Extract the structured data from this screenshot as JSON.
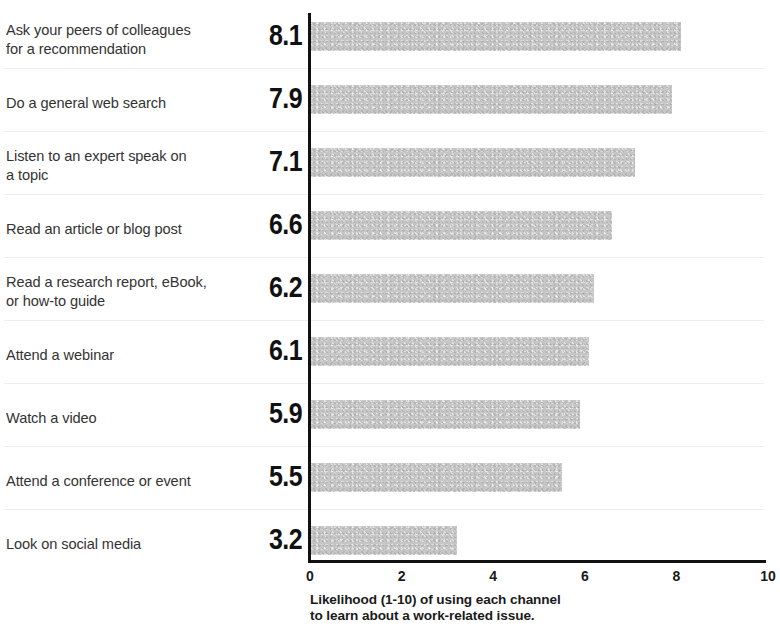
{
  "chart_data": {
    "type": "bar",
    "orientation": "horizontal",
    "title": "",
    "xlabel": "Likelihood (1-10) of using each channel\nto learn about a work-related issue.",
    "ylabel": "",
    "xlim": [
      0,
      10
    ],
    "xticks": [
      "0",
      "2",
      "4",
      "6",
      "8",
      "10"
    ],
    "xtick_values": [
      0,
      2,
      4,
      6,
      8,
      10
    ],
    "grid": false,
    "legend": false,
    "bar_color": "#c6c6c6",
    "categories": [
      "Ask your peers of colleagues\nfor a recommendation",
      "Do a general web search",
      "Listen to an expert speak on\na topic",
      "Read an article or blog post",
      "Read a research report, eBook,\nor how-to guide",
      "Attend a webinar",
      "Watch a video",
      "Attend a conference or event",
      "Look on social media"
    ],
    "values": [
      8.1,
      7.9,
      7.1,
      6.6,
      6.2,
      6.1,
      5.9,
      5.5,
      3.2
    ],
    "value_labels": [
      "8.1",
      "7.9",
      "7.1",
      "6.6",
      "6.2",
      "6.1",
      "5.9",
      "5.5",
      "3.2"
    ]
  },
  "rows": [
    {
      "label": "Ask your peers of colleagues\nfor a recommendation",
      "value": "8.1"
    },
    {
      "label": "Do a general web search",
      "value": "7.9"
    },
    {
      "label": "Listen to an expert speak on\na topic",
      "value": "7.1"
    },
    {
      "label": "Read an article or blog post",
      "value": "6.6"
    },
    {
      "label": "Read a research report, eBook,\nor how-to guide",
      "value": "6.2"
    },
    {
      "label": "Attend a webinar",
      "value": "6.1"
    },
    {
      "label": "Watch a video",
      "value": "5.9"
    },
    {
      "label": "Attend a conference or event",
      "value": "5.5"
    },
    {
      "label": "Look on social media",
      "value": "3.2"
    }
  ],
  "axis": {
    "caption": "Likelihood (1-10) of using each channel\nto learn about a work-related issue.",
    "ticks": [
      "0",
      "2",
      "4",
      "6",
      "8",
      "10"
    ]
  }
}
